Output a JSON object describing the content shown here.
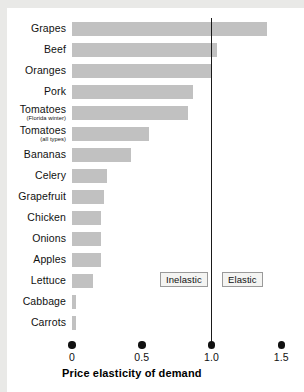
{
  "chart_data": {
    "type": "bar",
    "orientation": "horizontal",
    "title": "Price elasticity of demand",
    "xlabel": "Price elasticity of demand",
    "ylabel": "",
    "xlim": [
      0,
      1.55
    ],
    "xticks": [
      0,
      0.5,
      1.0,
      1.5
    ],
    "xtick_labels": [
      "0",
      "0.5",
      "1.0",
      "1.5"
    ],
    "grid": false,
    "legend_position": "inside-center",
    "bar_color": "#c1c1c1",
    "reference_line": {
      "value": 1.0,
      "label": "unit elastic",
      "color": "#1a1a1a"
    },
    "annotations": [
      {
        "text": "Inelastic",
        "region": "left-of-1.0"
      },
      {
        "text": "Elastic",
        "region": "right-of-1.0"
      }
    ],
    "categories": [
      "Grapes",
      "Beef",
      "Oranges",
      "Pork",
      "Tomatoes",
      "Tomatoes",
      "Bananas",
      "Celery",
      "Grapefruit",
      "Chicken",
      "Onions",
      "Apples",
      "Lettuce",
      "Cabbage",
      "Carrots"
    ],
    "category_sublabels": [
      "",
      "",
      "",
      "",
      "(Florida winter)",
      "(all types)",
      "",
      "",
      "",
      "",
      "",
      "",
      "",
      "",
      ""
    ],
    "values": [
      1.4,
      1.04,
      1.0,
      0.87,
      0.83,
      0.55,
      0.42,
      0.25,
      0.23,
      0.21,
      0.21,
      0.21,
      0.15,
      0.03,
      0.03
    ]
  },
  "axis": {
    "title": "Price elasticity of demand"
  },
  "legend": {
    "inelastic": "Inelastic",
    "elastic": "Elastic"
  },
  "colors": {
    "bar": "#c1c1c1",
    "line": "#1a1a1a",
    "text": "#111111",
    "panel": "#ffffff",
    "background": "#e9e9e7",
    "legend_border": "#9a9a9a",
    "legend_fill": "#f4f4f2"
  }
}
